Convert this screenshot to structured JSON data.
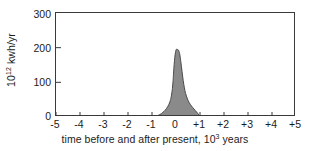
{
  "chart_data": {
    "type": "area",
    "title": "",
    "subtitle": "",
    "xlabel_text": "time before and after present, ",
    "xlabel_mantissa": "10",
    "xlabel_exponent": "3",
    "xlabel_unit": " years",
    "ylabel_mantissa": "10",
    "ylabel_exponent": "12",
    "ylabel_unit": " kwh/yr",
    "xlim": [
      -5,
      5
    ],
    "ylim": [
      0,
      300
    ],
    "xticks": [
      -5,
      -4,
      -3,
      -2,
      -1,
      0,
      1,
      2,
      3,
      4,
      5
    ],
    "xtick_labels": [
      "-5",
      "-4",
      "-3",
      "-2",
      "-1",
      "0",
      "+1",
      "+2",
      "+3",
      "+4",
      "+5"
    ],
    "yticks": [
      0,
      100,
      200,
      300
    ],
    "ytick_labels": [
      "0",
      "100",
      "200",
      "300"
    ],
    "grid": false,
    "legend": "none",
    "fill_color": "#8a8a8a",
    "line_color": "#4a4a4a",
    "frame_color": "#3a3a3a",
    "background": "#ffffff",
    "series": [
      {
        "name": "energy consumption",
        "x": [
          -5.0,
          -4.5,
          -4.0,
          -3.5,
          -3.0,
          -2.5,
          -2.0,
          -1.5,
          -1.2,
          -1.0,
          -0.9,
          -0.8,
          -0.7,
          -0.6,
          -0.5,
          -0.4,
          -0.3,
          -0.25,
          -0.2,
          -0.15,
          -0.12,
          -0.1,
          -0.05,
          0.0,
          0.05,
          0.1,
          0.15,
          0.2,
          0.25,
          0.3,
          0.35,
          0.4,
          0.5,
          0.6,
          0.7,
          0.8,
          0.9,
          1.0,
          1.1,
          1.5,
          2.0,
          3.0,
          4.0,
          5.0
        ],
        "y": [
          0,
          0,
          0,
          0,
          0,
          0,
          0,
          0,
          0,
          0,
          1,
          3,
          6,
          10,
          16,
          24,
          36,
          45,
          58,
          82,
          105,
          130,
          172,
          193,
          195,
          193,
          183,
          160,
          132,
          105,
          84,
          68,
          48,
          36,
          27,
          19,
          11,
          2,
          0,
          0,
          0,
          0,
          0,
          0
        ]
      }
    ],
    "annotations": {
      "peak_value": 195,
      "peak_position": 0.03,
      "base_start": -0.95,
      "base_end": 1.05
    }
  }
}
